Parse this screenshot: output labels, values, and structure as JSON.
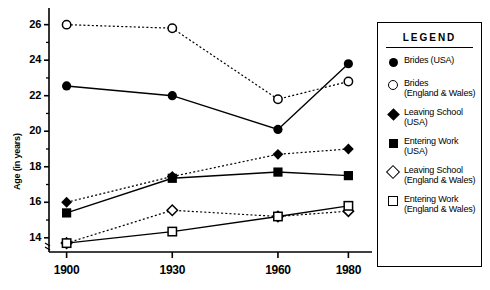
{
  "chart_data": {
    "type": "line",
    "title": "",
    "xlabel": "",
    "ylabel": "Age (in years)",
    "x": [
      1900,
      1930,
      1960,
      1980
    ],
    "categories": [
      "1900",
      "1930",
      "1960",
      "1980"
    ],
    "ylim": [
      13.2,
      26.6
    ],
    "yticks": [
      14,
      16,
      18,
      20,
      22,
      24,
      26
    ],
    "ytick_labels": [
      "14",
      "16",
      "18",
      "20",
      "22",
      "24",
      "26"
    ],
    "xlim": [
      1895,
      1985
    ],
    "grid": false,
    "legend_position": "right-outside",
    "series": [
      {
        "name": "Brides (USA)",
        "marker": "circle-filled",
        "line": "solid",
        "values": [
          22.55,
          22.0,
          20.1,
          23.8
        ]
      },
      {
        "name": "Brides (England & Wales)",
        "marker": "circle-open",
        "line": "dotted",
        "values": [
          26.0,
          25.8,
          21.8,
          22.8
        ]
      },
      {
        "name": "Leaving School (USA)",
        "marker": "diamond-filled",
        "line": "dotted",
        "values": [
          16.0,
          17.45,
          18.7,
          19.0
        ]
      },
      {
        "name": "Entering Work (USA)",
        "marker": "square-filled",
        "line": "solid",
        "values": [
          15.4,
          17.35,
          17.7,
          17.5
        ]
      },
      {
        "name": "Leaving School (England & Wales)",
        "marker": "diamond-open",
        "line": "dotted",
        "values": [
          13.7,
          15.55,
          15.2,
          15.5
        ]
      },
      {
        "name": "Entering Work (England & Wales)",
        "marker": "square-open",
        "line": "solid",
        "values": [
          13.7,
          14.35,
          15.2,
          15.8
        ]
      }
    ]
  },
  "legend": {
    "title": "LEGEND",
    "items": [
      {
        "marker": "circle-filled",
        "label": "Brides (USA)"
      },
      {
        "marker": "circle-open",
        "label": "Brides\n(England & Wales)"
      },
      {
        "marker": "diamond-filled",
        "label": "Leaving School\n(USA)"
      },
      {
        "marker": "square-filled",
        "label": "Entering Work\n(USA)"
      },
      {
        "marker": "diamond-open",
        "label": "Leaving School\n(England & Wales)"
      },
      {
        "marker": "square-open",
        "label": "Entering Work\n(England & Wales)"
      }
    ]
  },
  "colors": {
    "ink": "#000000",
    "background": "#ffffff"
  }
}
